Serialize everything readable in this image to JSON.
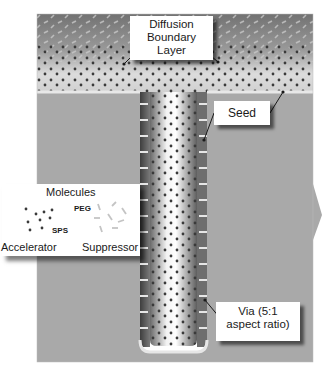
{
  "diagram": {
    "labels": {
      "diffusion": [
        "Diffusion",
        "Boundary",
        "Layer"
      ],
      "seed": "Seed",
      "via": [
        "Via (5:1",
        "aspect ratio)"
      ]
    },
    "legend": {
      "title": "Molecules",
      "accelerator_label": "Accelerator",
      "accelerator_species": "SPS",
      "suppressor_label": "Suppressor",
      "suppressor_species": "PEG"
    },
    "colors": {
      "electrolyte_top": "#7a7a7a",
      "electrolyte_bottom": "#d8d8d8",
      "substrate": "#a9a9a9",
      "field_surface": "#e6e6e6",
      "dot": "#3a3a3a",
      "suppressor_mark": "#c4c4c4"
    },
    "aspect_ratio": "5:1"
  }
}
